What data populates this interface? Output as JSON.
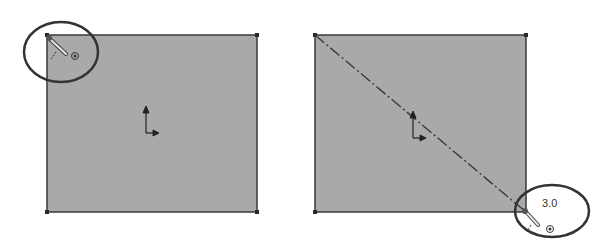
{
  "panels": [
    {
      "name": "before-panel",
      "rect": {
        "x": 47,
        "y": 35,
        "w": 210,
        "h": 177
      },
      "fill": "#a9a9a9",
      "stroke": "#3a3a3a",
      "highlight_ellipse": {
        "cx": 61,
        "cy": 52,
        "rx": 37,
        "ry": 30
      },
      "origin": {
        "x": 146,
        "y": 123
      }
    },
    {
      "name": "after-panel",
      "rect": {
        "x": 315,
        "y": 35,
        "w": 211,
        "h": 177
      },
      "fill": "#a9a9a9",
      "stroke": "#3a3a3a",
      "highlight_ellipse": {
        "cx": 552,
        "cy": 211,
        "rx": 37,
        "ry": 26
      },
      "origin": {
        "x": 413,
        "y": 128
      },
      "dimension_label": "3.0"
    }
  ],
  "colors": {
    "ellipse": "#333333",
    "construction_line": "#3a3a3a",
    "pencil": "#555555"
  }
}
